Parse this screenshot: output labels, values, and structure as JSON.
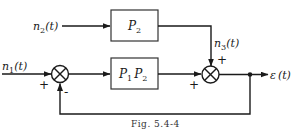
{
  "diagram": {
    "inputs": {
      "n1": {
        "label": "n",
        "sub": "1",
        "arg": "(t)"
      },
      "n2": {
        "label": "n",
        "sub": "2",
        "arg": "(t)"
      },
      "n3": {
        "label": "n",
        "sub": "3",
        "arg": "(t)"
      }
    },
    "blocks": {
      "top": {
        "label": "P",
        "sub": "2"
      },
      "main": {
        "label1": "P",
        "sub1": "1",
        "label2": "P",
        "sub2": "2"
      }
    },
    "junctions": {
      "first": {
        "in_sign": "+",
        "feedback_sign": "-"
      },
      "second": {
        "top_sign": "+",
        "left_sign": "+"
      }
    },
    "output": {
      "label": "ε",
      "arg": "(t)"
    },
    "caption": "Fig. 5.4-4",
    "colors": {
      "line": "#1a1a1a",
      "background": "#ffffff"
    }
  }
}
